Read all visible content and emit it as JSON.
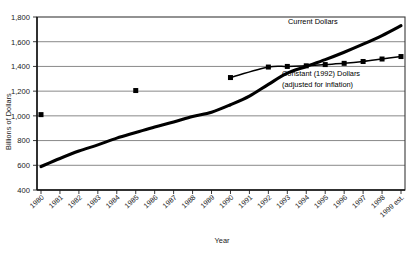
{
  "chart_data": {
    "type": "line",
    "title": "",
    "xlabel": "Year",
    "ylabel": "Billions of Dollars",
    "ylim": [
      400,
      1800
    ],
    "ytick_step": 200,
    "ytick_labels": [
      "400",
      "600",
      "800",
      "1,000",
      "1,200",
      "1,400",
      "1,600",
      "1,800"
    ],
    "ytick_values": [
      400,
      600,
      800,
      1000,
      1200,
      1400,
      1600,
      1800
    ],
    "grid": "horizontal",
    "legend_position": "inline-annotation",
    "categories": [
      "1980",
      "1981",
      "1982",
      "1983",
      "1984",
      "1985",
      "1986",
      "1987",
      "1988",
      "1989",
      "1990",
      "1991",
      "1992",
      "1993",
      "1994",
      "1995",
      "1996",
      "1997",
      "1998",
      "1999 est."
    ],
    "x": [
      1980,
      1981,
      1982,
      1983,
      1984,
      1985,
      1986,
      1987,
      1988,
      1989,
      1990,
      1991,
      1992,
      1993,
      1994,
      1995,
      1996,
      1997,
      1998,
      1999
    ],
    "series": [
      {
        "name": "Current Dollars",
        "style": "thick-line",
        "marker": "none",
        "values": [
          590,
          655,
          715,
          765,
          820,
          865,
          910,
          950,
          995,
          1030,
          1090,
          1160,
          1255,
          1345,
          1400,
          1455,
          1515,
          1580,
          1650,
          1730
        ]
      },
      {
        "name": "Constant (1992) Dollars",
        "style": "thin-line-with-square-markers",
        "marker": "square",
        "values": [
          1010,
          null,
          null,
          null,
          null,
          1205,
          null,
          null,
          null,
          null,
          1310,
          null,
          1395,
          1400,
          1405,
          1415,
          1425,
          1440,
          1460,
          1480
        ]
      }
    ],
    "annotations": [
      {
        "text": "Current Dollars",
        "series": "Current Dollars"
      },
      {
        "text": "Constant (1992) Dollars",
        "series": "Constant (1992) Dollars"
      },
      {
        "text": "(adjusted for inflation)",
        "series": "Constant (1992) Dollars"
      }
    ]
  }
}
